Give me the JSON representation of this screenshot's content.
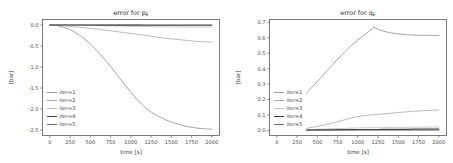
{
  "figure": {
    "width": 453,
    "height": 163,
    "background": "#ffffff"
  },
  "chart_data": [
    {
      "type": "line",
      "panel": "left",
      "title": "error for p",
      "title_subscript": "E",
      "xlabel": "time [s]",
      "ylabel": "[bar]",
      "xlim": [
        -90,
        2095
      ],
      "ylim": [
        -2.63,
        0.13
      ],
      "xticks": [
        0,
        250,
        500,
        750,
        1000,
        1250,
        1500,
        1750,
        2000
      ],
      "xticklabels": [
        "0",
        "250",
        "500",
        "750",
        "1000",
        "1250",
        "1500",
        "1750",
        "2000"
      ],
      "yticks": [
        0.0,
        -0.5,
        -1.0,
        -1.5,
        -2.0,
        -2.5
      ],
      "yticklabels": [
        "0.0",
        "-0.5",
        "-1.0",
        "-1.5",
        "-2.0",
        "-2.5"
      ],
      "grid": false,
      "legend_position": "lower left",
      "x": [
        0,
        100,
        200,
        300,
        400,
        500,
        600,
        700,
        800,
        900,
        1000,
        1100,
        1200,
        1250,
        1300,
        1400,
        1500,
        1600,
        1700,
        1800,
        1900,
        2000
      ],
      "series": [
        {
          "name": "iter=1",
          "color": "#9b9b9b",
          "linewidth": 0.9,
          "values": [
            0.0,
            -0.02,
            -0.07,
            -0.16,
            -0.29,
            -0.45,
            -0.65,
            -0.87,
            -1.11,
            -1.36,
            -1.6,
            -1.82,
            -2.0,
            -2.07,
            -2.13,
            -2.23,
            -2.31,
            -2.37,
            -2.42,
            -2.45,
            -2.47,
            -2.48
          ]
        },
        {
          "name": "iter=2",
          "color": "#a8a8a8",
          "linewidth": 0.8,
          "values": [
            0.0,
            -0.01,
            -0.02,
            -0.04,
            -0.06,
            -0.08,
            -0.1,
            -0.13,
            -0.15,
            -0.18,
            -0.2,
            -0.23,
            -0.25,
            -0.27,
            -0.28,
            -0.31,
            -0.33,
            -0.35,
            -0.37,
            -0.39,
            -0.4,
            -0.41
          ]
        },
        {
          "name": "iter=3",
          "color": "#bdbdbd",
          "linewidth": 0.8,
          "values": [
            0.0,
            -0.002,
            -0.004,
            -0.007,
            -0.01,
            -0.013,
            -0.016,
            -0.02,
            -0.024,
            -0.027,
            -0.031,
            -0.034,
            -0.037,
            -0.039,
            -0.04,
            -0.043,
            -0.045,
            -0.047,
            -0.049,
            -0.05,
            -0.051,
            -0.052
          ]
        },
        {
          "name": "iter=4",
          "color": "#3f3f3f",
          "linewidth": 1.1,
          "values": [
            0.0,
            0.0,
            -0.001,
            -0.001,
            -0.002,
            -0.002,
            -0.003,
            -0.003,
            -0.004,
            -0.004,
            -0.005,
            -0.005,
            -0.006,
            -0.006,
            -0.006,
            -0.007,
            -0.007,
            -0.007,
            -0.008,
            -0.008,
            -0.008,
            -0.008
          ]
        },
        {
          "name": "iter=5",
          "color": "#6e6e6e",
          "linewidth": 0.8,
          "values": [
            0.0,
            0.0,
            0.0,
            0.0,
            0.0,
            0.0,
            0.0,
            0.0,
            0.0,
            0.0,
            0.0,
            0.0,
            0.0,
            0.0,
            0.0,
            0.0,
            0.0,
            0.0,
            0.0,
            0.0,
            0.0,
            0.0
          ]
        }
      ]
    },
    {
      "type": "line",
      "panel": "right",
      "title": "error for q",
      "title_subscript": "E",
      "xlabel": "time [s]",
      "ylabel": "[bar]",
      "xlim": [
        -90,
        2095
      ],
      "ylim": [
        -0.033,
        0.718
      ],
      "xticks": [
        0,
        250,
        500,
        750,
        1000,
        1250,
        1500,
        1750,
        2000
      ],
      "xticklabels": [
        "0",
        "250",
        "500",
        "750",
        "1000",
        "1250",
        "1500",
        "1750",
        "2000"
      ],
      "yticks": [
        0.0,
        0.1,
        0.2,
        0.3,
        0.4,
        0.5,
        0.6,
        0.7
      ],
      "yticklabels": [
        "0.0",
        "0.1",
        "0.2",
        "0.3",
        "0.4",
        "0.5",
        "0.6",
        "0.7"
      ],
      "grid": false,
      "legend_position": "lower left",
      "x": [
        370,
        500,
        600,
        700,
        800,
        900,
        1000,
        1100,
        1200,
        1250,
        1300,
        1400,
        1500,
        1600,
        1700,
        1800,
        1900,
        2000
      ],
      "series": [
        {
          "name": "iter=1",
          "color": "#9b9b9b",
          "linewidth": 0.9,
          "values": [
            0.245,
            0.315,
            0.375,
            0.432,
            0.487,
            0.54,
            0.585,
            0.625,
            0.668,
            0.655,
            0.645,
            0.632,
            0.625,
            0.62,
            0.617,
            0.616,
            0.615,
            0.615
          ]
        },
        {
          "name": "iter=2",
          "color": "#a8a8a8",
          "linewidth": 0.8,
          "values": [
            0.013,
            0.026,
            0.037,
            0.05,
            0.063,
            0.077,
            0.09,
            0.097,
            0.102,
            0.104,
            0.106,
            0.111,
            0.116,
            0.12,
            0.124,
            0.127,
            0.13,
            0.132
          ]
        },
        {
          "name": "iter=3",
          "color": "#bdbdbd",
          "linewidth": 0.8,
          "values": [
            0.004,
            0.007,
            0.009,
            0.011,
            0.013,
            0.014,
            0.016,
            0.017,
            0.018,
            0.018,
            0.018,
            0.019,
            0.02,
            0.02,
            0.021,
            0.021,
            0.022,
            0.022
          ]
        },
        {
          "name": "iter=4",
          "color": "#3f3f3f",
          "linewidth": 1.2,
          "values": [
            0.002,
            0.003,
            0.004,
            0.004,
            0.005,
            0.005,
            0.006,
            0.006,
            0.006,
            0.006,
            0.007,
            0.007,
            0.007,
            0.007,
            0.008,
            0.008,
            0.008,
            0.008
          ]
        },
        {
          "name": "iter=5",
          "color": "#6e6e6e",
          "linewidth": 0.8,
          "values": [
            0.001,
            0.001,
            0.001,
            0.001,
            0.001,
            0.001,
            0.001,
            0.001,
            0.001,
            0.001,
            0.001,
            0.001,
            0.001,
            0.001,
            0.001,
            0.001,
            0.001,
            0.001
          ]
        }
      ]
    }
  ]
}
